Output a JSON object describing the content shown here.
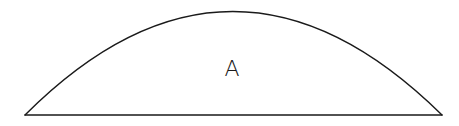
{
  "diagram": {
    "type": "circular-segment",
    "region_label": "A",
    "stroke_color": "#1a1a1a",
    "background_color": "#ffffff"
  }
}
